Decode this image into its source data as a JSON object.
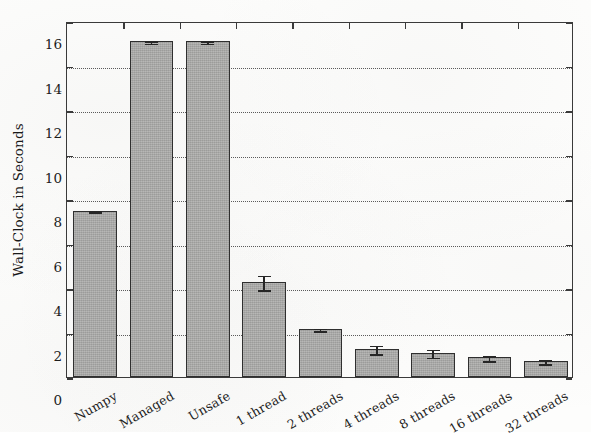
{
  "chart_data": {
    "type": "bar",
    "title": "",
    "subtitle": "",
    "xlabel": "",
    "ylabel": "Wall-Clock in Seconds",
    "ylim": [
      0,
      16
    ],
    "ytick_labels": [
      "0",
      "2",
      "4",
      "6",
      "8",
      "10",
      "12",
      "14",
      "16"
    ],
    "ytick_values": [
      0,
      2,
      4,
      6,
      8,
      10,
      12,
      14,
      16
    ],
    "grid": "horizontal-dotted",
    "legend": "none",
    "categories": [
      "Numpy",
      "Managed",
      "Unsafe",
      "1 thread",
      "2 threads",
      "4 threads",
      "8 threads",
      "16 threads",
      "32 threads"
    ],
    "values": [
      7.47,
      15.08,
      15.08,
      4.28,
      2.17,
      1.27,
      1.1,
      0.88,
      0.72
    ],
    "errors": [
      0.04,
      0.06,
      0.06,
      0.33,
      0.06,
      0.2,
      0.17,
      0.11,
      0.09
    ],
    "bar_color": "#a9a9a7",
    "bar_edge_color": "#2f2f2f",
    "error_bar_color": "#262626",
    "axis_color": "#3a3a3a",
    "grid_color": "#5b5b5b",
    "background_color": "#fdfdfc"
  }
}
